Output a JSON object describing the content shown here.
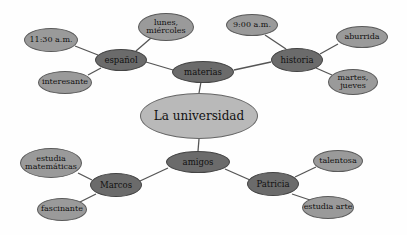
{
  "diagram": {
    "center": {
      "label": "La universidad",
      "x": 199,
      "y": 116,
      "w": 118,
      "h": 46
    },
    "branches": {
      "materias": {
        "label": "materias",
        "x": 203,
        "y": 72,
        "w": 62,
        "h": 22
      },
      "amigos": {
        "label": "amigos",
        "x": 198,
        "y": 162,
        "w": 64,
        "h": 22
      }
    },
    "sub": {
      "espanol": {
        "label": "español",
        "x": 121,
        "y": 60,
        "w": 52,
        "h": 22
      },
      "historia": {
        "label": "historia",
        "x": 297,
        "y": 60,
        "w": 52,
        "h": 24
      },
      "marcos": {
        "label": "Marcos",
        "x": 116,
        "y": 185,
        "w": 52,
        "h": 24
      },
      "patricia": {
        "label": "Patricia",
        "x": 273,
        "y": 184,
        "w": 52,
        "h": 24
      }
    },
    "leaves": {
      "espanol_time": {
        "label": "11:30 a.m.",
        "x": 51,
        "y": 40,
        "w": 54,
        "h": 24
      },
      "espanol_days": {
        "label": "lunes, miércoles",
        "x": 166,
        "y": 27,
        "w": 56,
        "h": 28
      },
      "espanol_desc": {
        "label": "interesante",
        "x": 65,
        "y": 82,
        "w": 54,
        "h": 23
      },
      "historia_time": {
        "label": "9:00 a.m.",
        "x": 252,
        "y": 25,
        "w": 52,
        "h": 22
      },
      "historia_desc": {
        "label": "aburrida",
        "x": 362,
        "y": 37,
        "w": 52,
        "h": 22
      },
      "historia_days": {
        "label": "martes, jueves",
        "x": 353,
        "y": 82,
        "w": 50,
        "h": 26
      },
      "marcos_study": {
        "label": "estudia matemáticas",
        "x": 51,
        "y": 163,
        "w": 62,
        "h": 30
      },
      "marcos_desc": {
        "label": "fascinante",
        "x": 62,
        "y": 209,
        "w": 50,
        "h": 23
      },
      "patricia_desc": {
        "label": "talentosa",
        "x": 338,
        "y": 161,
        "w": 50,
        "h": 22
      },
      "patricia_study": {
        "label": "estudia arte",
        "x": 328,
        "y": 207,
        "w": 52,
        "h": 23
      }
    },
    "colors": {
      "leaf_fill": "#9a9a9a",
      "mid_fill": "#6b6b6b",
      "center_fill": "#b9b9b9",
      "link": "#555555"
    }
  }
}
